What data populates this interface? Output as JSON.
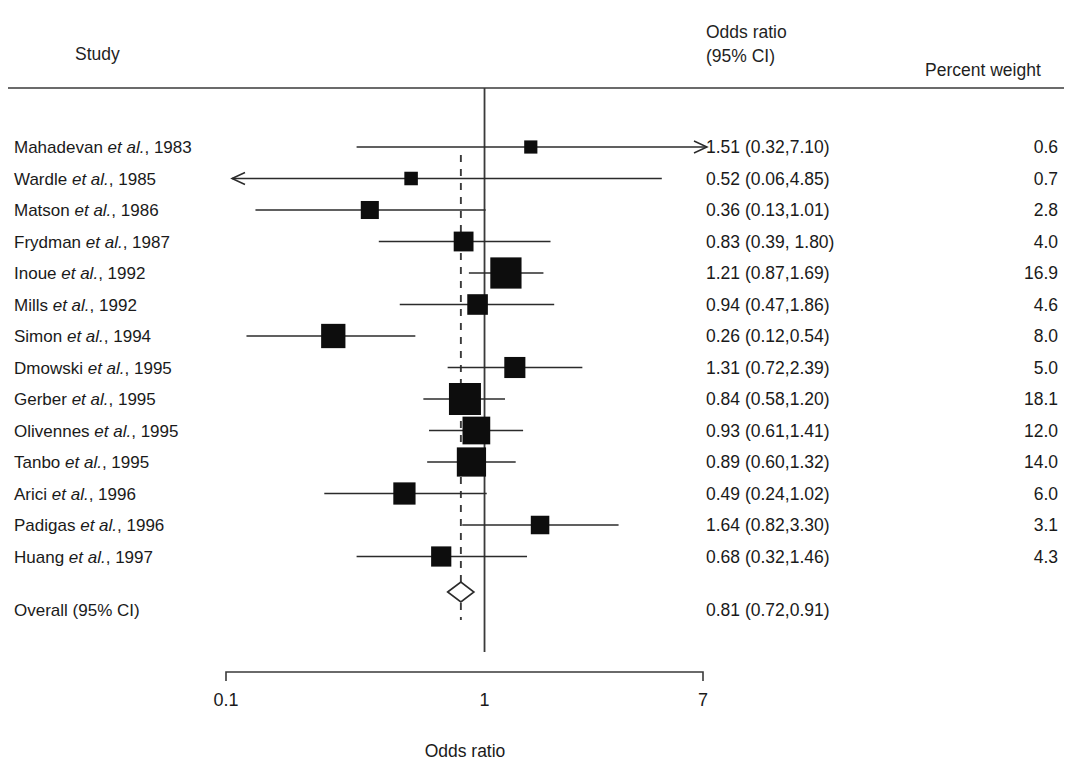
{
  "header": {
    "study_col": "Study",
    "or_col_line1": "Odds ratio",
    "or_col_line2": "(95% CI)",
    "weight_col": "Percent weight"
  },
  "axis": {
    "title": "Odds ratio",
    "ticks": [
      "0.1",
      "1",
      "7"
    ],
    "tick_values": [
      0.1,
      1,
      7
    ],
    "scale": "log",
    "xmin": 0.1,
    "xmax": 7
  },
  "overall": {
    "label": "Overall (95% CI)",
    "or_text": "0.81 (0.72,0.91)",
    "estimate": 0.81,
    "lower": 0.72,
    "upper": 0.91,
    "weight": ""
  },
  "colors": {
    "ink": "#1a1a1a",
    "rule": "#3a3a3a",
    "marker": "#0d0d0d",
    "background": "#ffffff"
  },
  "chart_data": {
    "type": "forest",
    "title": "",
    "xlabel": "Odds ratio",
    "ylabel": "",
    "xscale": "log",
    "xlim": [
      0.1,
      7
    ],
    "xticks": [
      0.1,
      1,
      7
    ],
    "xticklabels": [
      "0.1",
      "1",
      "7"
    ],
    "grid": false,
    "null_line": 1,
    "pooled_line": 0.81,
    "columns": [
      "Study",
      "Odds ratio (95% CI)",
      "Percent weight"
    ],
    "rows": [
      {
        "study": "Mahadevan",
        "study_suffix": "et al.",
        "year": "1983",
        "label": "Mahadevan et al., 1983",
        "or_text": "1.51 (0.32,7.10)",
        "estimate": 1.51,
        "lower": 0.32,
        "upper": 7.1,
        "weight": "0.6",
        "weight_value": 0.6,
        "clip_right": true,
        "clip_left": false
      },
      {
        "study": "Wardle",
        "study_suffix": "et al.",
        "year": "1985",
        "label": "Wardle et al., 1985",
        "or_text": "0.52 (0.06,4.85)",
        "estimate": 0.52,
        "lower": 0.06,
        "upper": 4.85,
        "weight": "0.7",
        "weight_value": 0.7,
        "clip_right": false,
        "clip_left": true
      },
      {
        "study": "Matson",
        "study_suffix": "et al.",
        "year": "1986",
        "label": "Matson et al., 1986",
        "or_text": "0.36 (0.13,1.01)",
        "estimate": 0.36,
        "lower": 0.13,
        "upper": 1.01,
        "weight": "2.8",
        "weight_value": 2.8,
        "clip_right": false,
        "clip_left": false
      },
      {
        "study": "Frydman",
        "study_suffix": "et al.",
        "year": "1987",
        "label": "Frydman et al., 1987",
        "or_text": "0.83 (0.39, 1.80)",
        "estimate": 0.83,
        "lower": 0.39,
        "upper": 1.8,
        "weight": "4.0",
        "weight_value": 4.0,
        "clip_right": false,
        "clip_left": false
      },
      {
        "study": "Inoue",
        "study_suffix": "et al.",
        "year": "1992",
        "label": "Inoue et al., 1992",
        "or_text": "1.21 (0.87,1.69)",
        "estimate": 1.21,
        "lower": 0.87,
        "upper": 1.69,
        "weight": "16.9",
        "weight_value": 16.9,
        "clip_right": false,
        "clip_left": false
      },
      {
        "study": "Mills",
        "study_suffix": "et al.",
        "year": "1992",
        "label": "Mills et al., 1992",
        "or_text": "0.94 (0.47,1.86)",
        "estimate": 0.94,
        "lower": 0.47,
        "upper": 1.86,
        "weight": "4.6",
        "weight_value": 4.6,
        "clip_right": false,
        "clip_left": false
      },
      {
        "study": "Simon",
        "study_suffix": "et al.",
        "year": "1994",
        "label": "Simon et al., 1994",
        "or_text": "0.26 (0.12,0.54)",
        "estimate": 0.26,
        "lower": 0.12,
        "upper": 0.54,
        "weight": "8.0",
        "weight_value": 8.0,
        "clip_right": false,
        "clip_left": false
      },
      {
        "study": "Dmowski",
        "study_suffix": "et al.",
        "year": "1995",
        "label": "Dmowski et al., 1995",
        "or_text": "1.31 (0.72,2.39)",
        "estimate": 1.31,
        "lower": 0.72,
        "upper": 2.39,
        "weight": "5.0",
        "weight_value": 5.0,
        "clip_right": false,
        "clip_left": false
      },
      {
        "study": "Gerber",
        "study_suffix": "et al.",
        "year": "1995",
        "label": "Gerber et al., 1995",
        "or_text": "0.84 (0.58,1.20)",
        "estimate": 0.84,
        "lower": 0.58,
        "upper": 1.2,
        "weight": "18.1",
        "weight_value": 18.1,
        "clip_right": false,
        "clip_left": false
      },
      {
        "study": "Olivennes",
        "study_suffix": "et al.",
        "year": "1995",
        "label": "Olivennes et al., 1995",
        "or_text": "0.93 (0.61,1.41)",
        "estimate": 0.93,
        "lower": 0.61,
        "upper": 1.41,
        "weight": "12.0",
        "weight_value": 12.0,
        "clip_right": false,
        "clip_left": false
      },
      {
        "study": "Tanbo",
        "study_suffix": "et al.",
        "year": "1995",
        "label": "Tanbo et al., 1995",
        "or_text": "0.89 (0.60,1.32)",
        "estimate": 0.89,
        "lower": 0.6,
        "upper": 1.32,
        "weight": "14.0",
        "weight_value": 14.0,
        "clip_right": false,
        "clip_left": false
      },
      {
        "study": "Arici",
        "study_suffix": "et al.",
        "year": "1996",
        "label": "Arici et al., 1996",
        "or_text": "0.49 (0.24,1.02)",
        "estimate": 0.49,
        "lower": 0.24,
        "upper": 1.02,
        "weight": "6.0",
        "weight_value": 6.0,
        "clip_right": false,
        "clip_left": false
      },
      {
        "study": "Padigas",
        "study_suffix": "et al.",
        "year": "1996",
        "label": "Padigas et al., 1996",
        "or_text": "1.64 (0.82,3.30)",
        "estimate": 1.64,
        "lower": 0.82,
        "upper": 3.3,
        "weight": "3.1",
        "weight_value": 3.1,
        "clip_right": false,
        "clip_left": false
      },
      {
        "study": "Huang",
        "study_suffix": "et al.",
        "year": "1997",
        "label": "Huang et al., 1997",
        "or_text": "0.68 (0.32,1.46)",
        "estimate": 0.68,
        "lower": 0.32,
        "upper": 1.46,
        "weight": "4.3",
        "weight_value": 4.3,
        "clip_right": false,
        "clip_left": false
      }
    ],
    "overall": {
      "label": "Overall (95% CI)",
      "estimate": 0.81,
      "lower": 0.72,
      "upper": 0.91,
      "or_text": "0.81 (0.72,0.91)"
    }
  }
}
